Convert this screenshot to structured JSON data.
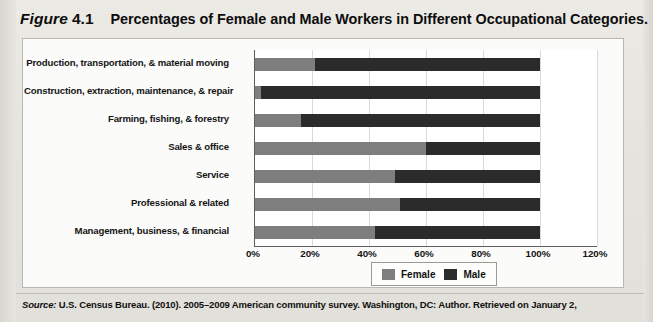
{
  "figure": {
    "label": "Figure",
    "number": "4.1",
    "title": "Percentages of Female and Male Workers in Different Occupational Categories."
  },
  "source": {
    "label": "Source:",
    "text": "U.S. Census Bureau. (2010). 2005–2009 American community survey. Washington, DC: Author. Retrieved on January 2,"
  },
  "legend": {
    "items": [
      {
        "label": "Female",
        "color": "#7e7e7e",
        "swatch": "female-swatch"
      },
      {
        "label": "Male",
        "color": "#2b2b2b",
        "swatch": "male-swatch"
      }
    ]
  },
  "chart_data": {
    "type": "bar",
    "orientation": "horizontal",
    "stacked": true,
    "title": "Percentages of Female and Male Workers in Different Occupational Categories.",
    "xlabel": "",
    "ylabel": "",
    "xlim": [
      0,
      120
    ],
    "xticks": [
      0,
      20,
      40,
      60,
      80,
      100,
      120
    ],
    "xtick_labels": [
      "0%",
      "20%",
      "40%",
      "60%",
      "80%",
      "100%",
      "120%"
    ],
    "grid": true,
    "legend_position": "bottom",
    "categories": [
      "Production, transportation, & material moving",
      "Construction, extraction, maintenance, & repair",
      "Farming, fishing, & forestry",
      "Sales & office",
      "Service",
      "Professional & related",
      "Management, business, & financial"
    ],
    "series": [
      {
        "name": "Female",
        "color": "#7e7e7e",
        "values": [
          21,
          2,
          16,
          60,
          49,
          51,
          42
        ]
      },
      {
        "name": "Male",
        "color": "#2b2b2b",
        "values": [
          79,
          98,
          84,
          40,
          51,
          49,
          58
        ]
      }
    ]
  }
}
